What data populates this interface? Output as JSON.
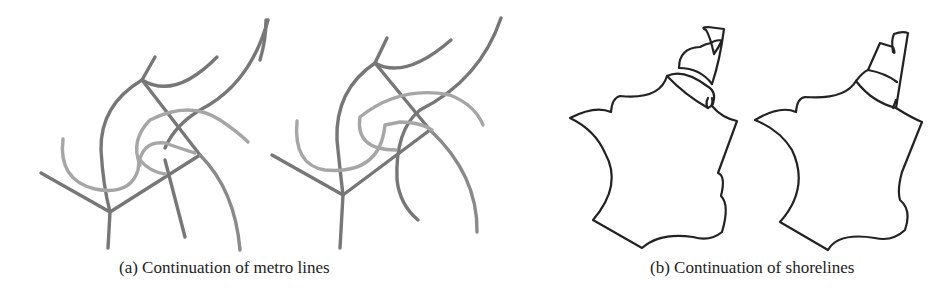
{
  "figure": {
    "subfigures": [
      {
        "id": "a",
        "caption": "(a) Continuation of metro lines",
        "panels": [
          "metro-input",
          "metro-completed"
        ]
      },
      {
        "id": "b",
        "caption": "(b) Continuation of shorelines",
        "panels": [
          "shoreline-input",
          "shoreline-completed"
        ]
      }
    ]
  },
  "captions": {
    "a": "(a) Continuation of metro lines",
    "b": "(b) Continuation of shorelines"
  }
}
